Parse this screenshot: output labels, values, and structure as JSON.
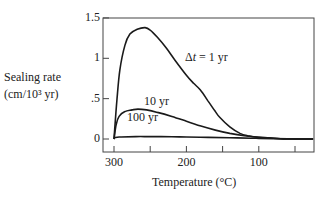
{
  "chart_data": {
    "type": "line",
    "title": "",
    "xlabel": "Temperature (°C)",
    "ylabel": "Sealing rate (cm/10³ yr)",
    "ylabel_lines": [
      "Sealing rate",
      "(cm/10³ yr)"
    ],
    "xlim": [
      315,
      25
    ],
    "ylim": [
      -0.15,
      1.5
    ],
    "x_inverted": true,
    "grid": false,
    "x_ticks": [
      300,
      250,
      200,
      150,
      100,
      50
    ],
    "x_tick_labels": [
      "300",
      "",
      "200",
      "",
      "100",
      ""
    ],
    "y_ticks": [
      0,
      0.5,
      1,
      1.5
    ],
    "y_tick_labels": [
      "0",
      ".5",
      "1",
      "1.5"
    ],
    "series": [
      {
        "name": "Δt = 1 yr",
        "label_pos": {
          "x": 185,
          "y": 50
        },
        "x": [
          300,
          296,
          292,
          285,
          278,
          268,
          257,
          250,
          240,
          228,
          216,
          200,
          190,
          181,
          170,
          160,
          154,
          140,
          126,
          115,
          100,
          80,
          60,
          40,
          25
        ],
        "y": [
          0.0,
          0.48,
          0.85,
          1.16,
          1.3,
          1.36,
          1.38,
          1.35,
          1.26,
          1.13,
          0.98,
          0.79,
          0.69,
          0.61,
          0.47,
          0.34,
          0.27,
          0.15,
          0.07,
          0.04,
          0.02,
          0.01,
          0.0,
          0.0,
          0.0
        ]
      },
      {
        "name": "10 yr",
        "label_pos": {
          "x": 144,
          "y": 94
        },
        "x": [
          300,
          297,
          293,
          285,
          275,
          267,
          255,
          240,
          220,
          200,
          180,
          160,
          140,
          120,
          100,
          80,
          60,
          40,
          25
        ],
        "y": [
          0.0,
          0.18,
          0.28,
          0.34,
          0.36,
          0.37,
          0.36,
          0.33,
          0.28,
          0.22,
          0.16,
          0.11,
          0.07,
          0.04,
          0.02,
          0.01,
          0.0,
          0.0,
          0.0
        ]
      },
      {
        "name": "100 yr",
        "label_pos": {
          "x": 127,
          "y": 110
        },
        "x": [
          300,
          298,
          290,
          270,
          250,
          220,
          200,
          170,
          140,
          110,
          100,
          80,
          60,
          40,
          25
        ],
        "y": [
          0.0,
          0.02,
          0.025,
          0.03,
          0.03,
          0.028,
          0.025,
          0.02,
          0.015,
          0.01,
          0.008,
          0.005,
          0.003,
          0.0,
          0.0
        ]
      }
    ],
    "legend_position": "inline-annotations"
  },
  "plot_box": {
    "left": 103,
    "top": 18,
    "right": 314,
    "bottom": 152
  },
  "axis_map": {
    "x0_val": 300,
    "x0_px": 114,
    "px_per_unit_x": 0.724,
    "y0_px": 139,
    "px_per_unit_y": 80.7
  },
  "colors": {
    "line": "#1a1a1a",
    "axis": "#444444",
    "text": "#222222"
  }
}
